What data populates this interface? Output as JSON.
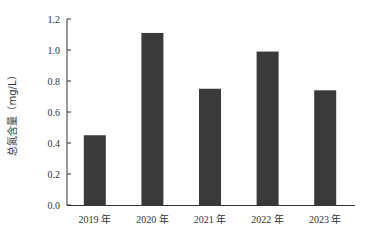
{
  "chart_data": {
    "type": "bar",
    "title": "",
    "xlabel": "",
    "ylabel": "总氮含量（mg/L）",
    "categories": [
      "2019 年",
      "2020 年",
      "2021 年",
      "2022 年",
      "2023 年"
    ],
    "values": [
      0.45,
      1.11,
      0.75,
      0.99,
      0.74
    ],
    "ylim": [
      0,
      1.2
    ],
    "yticks": [
      "0.0",
      "0.2",
      "0.4",
      "0.6",
      "0.8",
      "1.0",
      "1.2"
    ],
    "ytick_values": [
      0,
      0.2,
      0.4,
      0.6,
      0.8,
      1.0,
      1.2
    ],
    "grid": false,
    "legend": null,
    "bar_color": "#3a3a3a",
    "axis_color": "#333333"
  }
}
